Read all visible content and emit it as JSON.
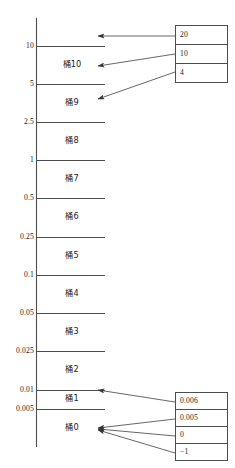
{
  "figure": {
    "title": "",
    "axis": {
      "name": "value-axis",
      "orientation": "vertical",
      "ticks": [
        {
          "label": "10",
          "y": 46
        },
        {
          "label": "5",
          "y": 84
        },
        {
          "label": "2.5",
          "y": 122
        },
        {
          "label": "1",
          "y": 160
        },
        {
          "label": "0.5",
          "y": 198
        },
        {
          "label": "0.25",
          "y": 237
        },
        {
          "label": "0.1",
          "y": 275
        },
        {
          "label": "0.05",
          "y": 313
        },
        {
          "label": "0.025",
          "y": 351
        },
        {
          "label": "0.01",
          "y": 390
        },
        {
          "label": "0.005",
          "y": 409
        }
      ]
    },
    "buckets": [
      {
        "label": "桶10",
        "y": 65
      },
      {
        "label": "桶9",
        "y": 103
      },
      {
        "label": "桶8",
        "y": 141
      },
      {
        "label": "桶7",
        "y": 179
      },
      {
        "label": "桶6",
        "y": 217
      },
      {
        "label": "桶5",
        "y": 256
      },
      {
        "label": "桶4",
        "y": 294
      },
      {
        "label": "桶3",
        "y": 332
      },
      {
        "label": "桶2",
        "y": 370
      },
      {
        "label": "桶1",
        "y": 399
      },
      {
        "label": "桶0",
        "y": 428
      }
    ],
    "top_box": {
      "name": "top-value-list",
      "cells": [
        {
          "value": "20",
          "y": 35
        },
        {
          "value": "10",
          "y": 54
        },
        {
          "value": "4",
          "y": 73
        }
      ]
    },
    "bottom_box": {
      "name": "bottom-value-list",
      "cells": [
        {
          "value": "0.006",
          "y": 401
        },
        {
          "value": "0.005",
          "y": 418
        },
        {
          "value": "0",
          "y": 435
        },
        {
          "value": "−1",
          "y": 452
        }
      ]
    },
    "colors": {
      "line": "#4d4d4d",
      "axis": "#4d4d4d",
      "box_border": "#4d4d4d",
      "text": "#1a1a1a",
      "background": "#ffffff"
    }
  },
  "chart_data": {
    "type": "diagram",
    "title": "",
    "xlabel": "",
    "ylabel": "",
    "axis_ticks": [
      "10",
      "5",
      "2.5",
      "1",
      "0.5",
      "0.25",
      "0.1",
      "0.05",
      "0.025",
      "0.01",
      "0.005"
    ],
    "categories": [
      "桶10",
      "桶9",
      "桶8",
      "桶7",
      "桶6",
      "桶5",
      "桶4",
      "桶3",
      "桶2",
      "桶1",
      "桶0"
    ],
    "bucket_ranges": [
      {
        "bucket": "桶10",
        "lower": "5",
        "upper": "10"
      },
      {
        "bucket": "桶9",
        "lower": "2.5",
        "upper": "5"
      },
      {
        "bucket": "桶8",
        "lower": "1",
        "upper": "2.5"
      },
      {
        "bucket": "桶7",
        "lower": "0.5",
        "upper": "1"
      },
      {
        "bucket": "桶6",
        "lower": "0.25",
        "upper": "0.5"
      },
      {
        "bucket": "桶5",
        "lower": "0.1",
        "upper": "0.25"
      },
      {
        "bucket": "桶4",
        "lower": "0.05",
        "upper": "0.1"
      },
      {
        "bucket": "桶3",
        "lower": "0.025",
        "upper": "0.05"
      },
      {
        "bucket": "桶2",
        "lower": "0.01",
        "upper": "0.025"
      },
      {
        "bucket": "桶1",
        "lower": "0.005",
        "upper": "0.01"
      },
      {
        "bucket": "桶0",
        "lower": "",
        "upper": "0.005"
      }
    ],
    "top_values": [
      "20",
      "10",
      "4"
    ],
    "bottom_values": [
      "0.006",
      "0.005",
      "0",
      "−1"
    ],
    "mappings": [
      {
        "value": "20",
        "target": "above 10"
      },
      {
        "value": "10",
        "target": "桶10"
      },
      {
        "value": "4",
        "target": "桶9"
      },
      {
        "value": "0.006",
        "target": "桶1"
      },
      {
        "value": "0.005",
        "target": "桶0"
      },
      {
        "value": "0",
        "target": "桶0"
      },
      {
        "value": "−1",
        "target": "桶0"
      }
    ]
  }
}
